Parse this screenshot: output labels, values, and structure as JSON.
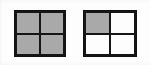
{
  "figure": {
    "background_color": "#fdfdfd",
    "line_color": "#161616",
    "fill_color": "#a9a9a9",
    "empty_color": "#fdfdfd",
    "shapes": [
      {
        "name": "square-left",
        "type": "2x2-grid-square",
        "x": 14,
        "y": 10,
        "width": 52,
        "height": 47,
        "quadrants": [
          {
            "position": "top-left",
            "state": "filled"
          },
          {
            "position": "top-right",
            "state": "filled"
          },
          {
            "position": "bottom-left",
            "state": "filled"
          },
          {
            "position": "bottom-right",
            "state": "filled"
          }
        ]
      },
      {
        "name": "square-right",
        "type": "2x2-grid-square",
        "x": 83,
        "y": 10,
        "width": 54,
        "height": 47,
        "quadrants": [
          {
            "position": "top-left",
            "state": "filled"
          },
          {
            "position": "top-right",
            "state": "empty"
          },
          {
            "position": "bottom-left",
            "state": "empty"
          },
          {
            "position": "bottom-right",
            "state": "empty"
          }
        ]
      }
    ]
  }
}
